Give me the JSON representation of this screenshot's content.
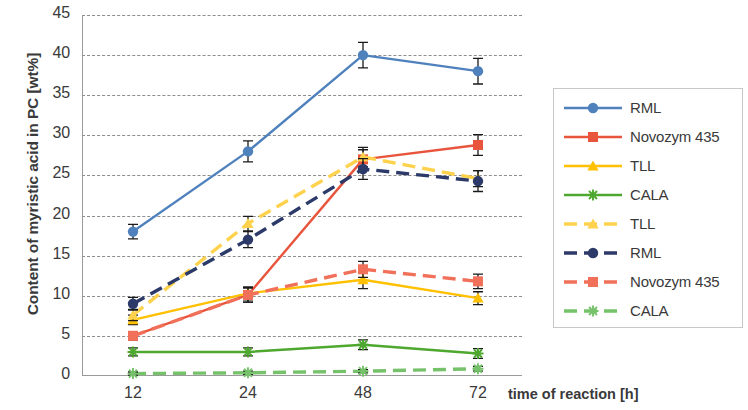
{
  "chart_data": {
    "type": "line",
    "title": "",
    "xlabel": "time of reaction [h]",
    "ylabel": "Content of myristic acid in PC [wt%]",
    "categories": [
      "12",
      "24",
      "48",
      "72"
    ],
    "x_tick_labels": [
      "12",
      "24",
      "48",
      "72"
    ],
    "y_tick_labels": [
      "0",
      "5",
      "10",
      "15",
      "20",
      "25",
      "30",
      "35",
      "40",
      "45"
    ],
    "ylim": [
      0,
      45
    ],
    "y_tick_step": 5,
    "grid": "horizontal-dashed",
    "legend_position": "right",
    "series": [
      {
        "name": "RML",
        "style": "solid",
        "color": "#4f81bd",
        "marker": "circle",
        "values": [
          18.0,
          28.0,
          40.0,
          38.0
        ],
        "errors": [
          0.9,
          1.3,
          1.6,
          1.6
        ]
      },
      {
        "name": "Novozym 435",
        "style": "solid",
        "color": "#e8553c",
        "marker": "square",
        "values": [
          5.0,
          10.1,
          27.0,
          28.8
        ],
        "errors": [
          0.5,
          0.9,
          1.2,
          1.3
        ]
      },
      {
        "name": "TLL",
        "style": "solid",
        "color": "#ffc000",
        "marker": "triangle",
        "values": [
          7.0,
          10.3,
          12.0,
          9.7
        ],
        "errors": [
          0.6,
          0.8,
          1.1,
          0.8
        ]
      },
      {
        "name": "CALA",
        "style": "solid",
        "color": "#4ea72e",
        "marker": "star",
        "values": [
          3.0,
          3.0,
          3.9,
          2.8
        ],
        "errors": [
          0.5,
          0.5,
          0.6,
          0.6
        ]
      },
      {
        "name": "TLL",
        "style": "dashed",
        "color": "#ffd24d",
        "marker": "triangle",
        "values": [
          7.6,
          19.0,
          27.3,
          24.6
        ],
        "errors": [
          0.7,
          0.9,
          1.2,
          1.0
        ]
      },
      {
        "name": "RML",
        "style": "dashed",
        "color": "#2b3a68",
        "marker": "circle",
        "values": [
          9.0,
          17.0,
          25.8,
          24.3
        ],
        "errors": [
          0.8,
          1.0,
          1.3,
          1.3
        ]
      },
      {
        "name": "Novozym 435",
        "style": "dashed",
        "color": "#f0705a",
        "marker": "square",
        "values": [
          5.0,
          10.1,
          13.3,
          11.8
        ],
        "errors": [
          0.5,
          0.9,
          1.0,
          0.9
        ]
      },
      {
        "name": "CALA",
        "style": "dashed",
        "color": "#76c26a",
        "marker": "star",
        "values": [
          0.3,
          0.4,
          0.6,
          0.9
        ],
        "errors": [
          0.2,
          0.2,
          0.2,
          0.3
        ]
      }
    ]
  },
  "legend": {
    "entries": [
      {
        "label": "RML"
      },
      {
        "label": "Novozym 435"
      },
      {
        "label": "TLL"
      },
      {
        "label": "CALA"
      },
      {
        "label": "TLL"
      },
      {
        "label": "RML"
      },
      {
        "label": "Novozym 435"
      },
      {
        "label": "CALA"
      }
    ]
  }
}
